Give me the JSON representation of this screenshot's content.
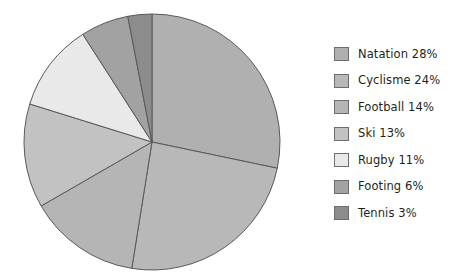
{
  "chart_data": {
    "type": "pie",
    "title": "",
    "legend_position": "right",
    "start_angle_deg": 0,
    "direction": "clockwise",
    "categories": [
      "Natation",
      "Cyclisme",
      "Football",
      "Ski",
      "Rugby",
      "Footing",
      "Tennis"
    ],
    "values": [
      28,
      24,
      14,
      13,
      11,
      6,
      3
    ],
    "value_unit": "%",
    "colors": [
      "#b0b0b0",
      "#b8b8b8",
      "#b5b5b5",
      "#c2c2c2",
      "#e9e9e9",
      "#a2a2a2",
      "#8c8c8c"
    ],
    "slice_border_color": "#595959",
    "labels": [
      "Natation 28%",
      "Cyclisme 24%",
      "Football 14%",
      "Ski 13%",
      "Rugby 11%",
      "Footing 6%",
      "Tennis 3%"
    ]
  },
  "legend": {
    "items": [
      {
        "label": "Natation 28%",
        "color": "#b0b0b0",
        "name": "natation"
      },
      {
        "label": "Cyclisme 24%",
        "color": "#b8b8b8",
        "name": "cyclisme"
      },
      {
        "label": "Football 14%",
        "color": "#b5b5b5",
        "name": "football"
      },
      {
        "label": "Ski 13%",
        "color": "#c2c2c2",
        "name": "ski"
      },
      {
        "label": "Rugby 11%",
        "color": "#e9e9e9",
        "name": "rugby"
      },
      {
        "label": "Footing 6%",
        "color": "#a2a2a2",
        "name": "footing"
      },
      {
        "label": "Tennis 3%",
        "color": "#8c8c8c",
        "name": "tennis"
      }
    ]
  },
  "geometry": {
    "center_x": 152,
    "center_y": 142,
    "radius": 128
  }
}
